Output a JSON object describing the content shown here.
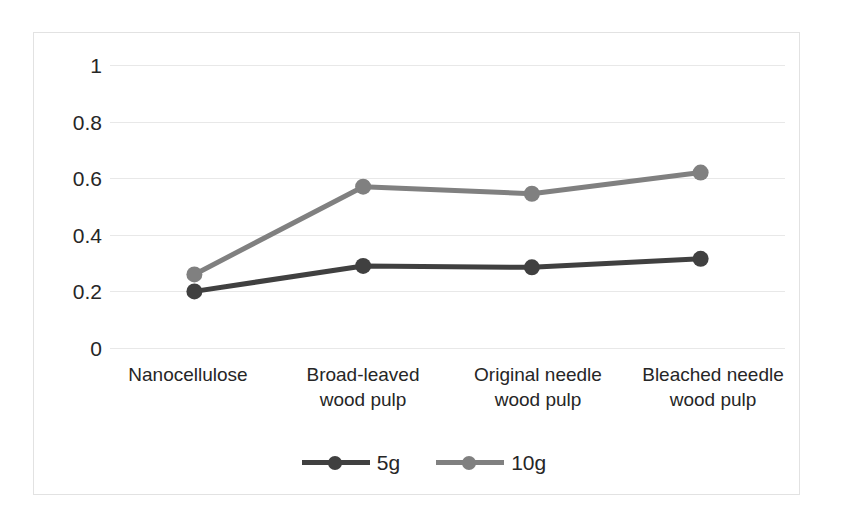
{
  "chart_data": {
    "type": "line",
    "title": "",
    "xlabel": "",
    "ylabel": "",
    "categories": [
      "Nanocellulose",
      "Broad-leaved\nwood pulp",
      "Original needle\nwood pulp",
      "Bleached needle\nwood pulp"
    ],
    "series": [
      {
        "name": "5g",
        "values": [
          0.2,
          0.29,
          0.285,
          0.315
        ],
        "color": "#404040"
      },
      {
        "name": "10g",
        "values": [
          0.26,
          0.57,
          0.545,
          0.62
        ],
        "color": "#808080"
      }
    ],
    "ylim": [
      0,
      1
    ],
    "yticks": [
      "0",
      "0.2",
      "0.4",
      "0.6",
      "0.8",
      "1"
    ],
    "grid": true,
    "legend_position": "bottom"
  },
  "axis": {
    "y_tick_labels": [
      "1",
      "0.8",
      "0.6",
      "0.4",
      "0.2",
      "0"
    ],
    "x_tick_labels": [
      {
        "line1": "Nanocellulose",
        "line2": ""
      },
      {
        "line1": "Broad-leaved",
        "line2": "wood pulp"
      },
      {
        "line1": "Original needle",
        "line2": "wood pulp"
      },
      {
        "line1": "Bleached needle",
        "line2": "wood pulp"
      }
    ]
  },
  "legend": {
    "items": [
      {
        "label": "5g",
        "color": "#404040"
      },
      {
        "label": "10g",
        "color": "#808080"
      }
    ]
  },
  "colors": {
    "series_5g": "#404040",
    "series_10g": "#808080",
    "gridline": "#e8e8e8",
    "frame": "#e2e2e2",
    "text": "#262626",
    "background": "#ffffff"
  }
}
